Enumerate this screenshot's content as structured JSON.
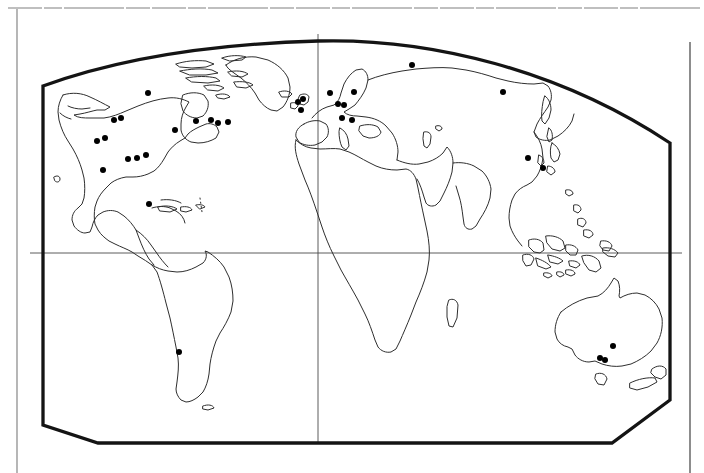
{
  "figure": {
    "kind": "world-distribution-dot-map",
    "title": "",
    "projection": "rounded-rectangular (Eckert-like) world outline",
    "background_color": "#ffffff",
    "ink_color": "#1a1a1a",
    "dot_color": "#000000",
    "coastline_color": "#2b2b2b",
    "graticule_color": "#4a4a4a",
    "page_rule_color": "#555555"
  },
  "frame": {
    "page_border": {
      "left_x": 17,
      "top_y": 8,
      "visible": true
    },
    "page_vertical_rule": {
      "x": 690,
      "y_start": 42,
      "y_end": 473,
      "visible": true
    },
    "map_border": {
      "left_x": 43,
      "right_x": 670,
      "bottom_y": 443,
      "top_apex_y": 45,
      "stroke_width": 3.2,
      "chamfer_bottom_left": [
        [
          43,
          425
        ],
        [
          98,
          443
        ]
      ],
      "chamfer_bottom_right": [
        [
          670,
          400
        ],
        [
          612,
          443
        ]
      ]
    }
  },
  "graticule": {
    "prime_meridian": {
      "label": "",
      "x": 318,
      "y_top": 33,
      "y_bottom": 443
    },
    "equator": {
      "label": "",
      "y": 253,
      "x_left": 30,
      "x_right": 680
    }
  },
  "legend": {
    "present": false,
    "items": []
  },
  "axis_labels": {
    "x": "",
    "y": ""
  },
  "chart_data": {
    "type": "scatter",
    "title": "",
    "xlabel": "",
    "ylabel": "",
    "grid": true,
    "legend_position": "none",
    "xlim": [
      0,
      704
    ],
    "ylim": [
      473,
      0
    ],
    "series": [
      {
        "name": "occurrence records",
        "marker": "filled-circle",
        "marker_radius_px": 3.0,
        "count": 31,
        "points": [
          {
            "x": 148,
            "y": 93,
            "region": "North America - Canada (central)"
          },
          {
            "x": 121,
            "y": 118,
            "region": "North America - Pacific Northwest"
          },
          {
            "x": 114,
            "y": 120,
            "region": "North America - Pacific Northwest"
          },
          {
            "x": 97,
            "y": 141,
            "region": "North America - Oregon/California"
          },
          {
            "x": 105,
            "y": 138,
            "region": "North America - Great Basin"
          },
          {
            "x": 103,
            "y": 170,
            "region": "North America - Southwest"
          },
          {
            "x": 128,
            "y": 159,
            "region": "North America - Colorado"
          },
          {
            "x": 137,
            "y": 158,
            "region": "North America - Central Plains"
          },
          {
            "x": 146,
            "y": 155,
            "region": "North America - Midwest"
          },
          {
            "x": 175,
            "y": 130,
            "region": "North America - Great Lakes"
          },
          {
            "x": 196,
            "y": 121,
            "region": "North America - Northeast US"
          },
          {
            "x": 211,
            "y": 120,
            "region": "North America - New England"
          },
          {
            "x": 218,
            "y": 123,
            "region": "North America - Maritime Canada"
          },
          {
            "x": 228,
            "y": 122,
            "region": "North America - Newfoundland"
          },
          {
            "x": 149,
            "y": 204,
            "region": "Caribbean / Central America"
          },
          {
            "x": 298,
            "y": 102,
            "region": "Europe - British Isles"
          },
          {
            "x": 303,
            "y": 99,
            "region": "Europe - British Isles"
          },
          {
            "x": 301,
            "y": 110,
            "region": "Europe - Ireland/UK"
          },
          {
            "x": 330,
            "y": 93,
            "region": "Europe - Scandinavia/Denmark"
          },
          {
            "x": 338,
            "y": 104,
            "region": "Europe - Germany/Poland"
          },
          {
            "x": 344,
            "y": 105,
            "region": "Europe - Central Europe"
          },
          {
            "x": 354,
            "y": 92,
            "region": "Europe - Baltic"
          },
          {
            "x": 342,
            "y": 118,
            "region": "Europe - Alps"
          },
          {
            "x": 352,
            "y": 120,
            "region": "Europe - Balkans"
          },
          {
            "x": 412,
            "y": 65,
            "region": "Russia - Arctic northwest"
          },
          {
            "x": 503,
            "y": 92,
            "region": "Russia - Siberia (Lake Baikal)"
          },
          {
            "x": 528,
            "y": 158,
            "region": "Asia - eastern China"
          },
          {
            "x": 543,
            "y": 168,
            "region": "Asia - Japan / Korea"
          },
          {
            "x": 179,
            "y": 352,
            "region": "South America - Chile/Argentina"
          },
          {
            "x": 613,
            "y": 346,
            "region": "Australia - New South Wales"
          },
          {
            "x": 600,
            "y": 358,
            "region": "Australia - Victoria"
          },
          {
            "x": 605,
            "y": 360,
            "region": "Australia - Victoria/Tasmania"
          }
        ]
      }
    ]
  }
}
